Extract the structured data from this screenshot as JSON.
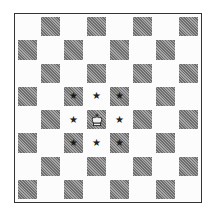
{
  "diagram": {
    "type": "chessboard",
    "size": 8,
    "light_color": "#fcfcfc",
    "dark_color": "#888888",
    "top_left_square": "light",
    "pieces": [
      {
        "name": "king",
        "color": "white",
        "row": 4,
        "col": 3,
        "glyph": "♔"
      }
    ],
    "marks": [
      {
        "row": 3,
        "col": 2,
        "glyph": "★"
      },
      {
        "row": 3,
        "col": 3,
        "glyph": "★"
      },
      {
        "row": 3,
        "col": 4,
        "glyph": "★"
      },
      {
        "row": 4,
        "col": 2,
        "glyph": "★"
      },
      {
        "row": 4,
        "col": 4,
        "glyph": "★"
      },
      {
        "row": 5,
        "col": 2,
        "glyph": "★"
      },
      {
        "row": 5,
        "col": 3,
        "glyph": "★"
      },
      {
        "row": 5,
        "col": 4,
        "glyph": "★"
      }
    ]
  }
}
